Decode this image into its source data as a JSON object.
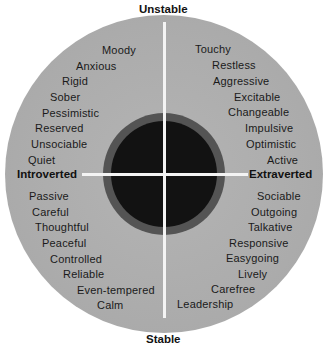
{
  "diagram": {
    "axes": {
      "top": "Unstable",
      "bottom": "Stable",
      "left": "Introverted",
      "right": "Extraverted"
    },
    "quadrants": {
      "unstable_introverted": [
        "Moody",
        "Anxious",
        "Rigid",
        "Sober",
        "Pessimistic",
        "Reserved",
        "Unsociable",
        "Quiet"
      ],
      "unstable_extraverted": [
        "Touchy",
        "Restless",
        "Aggressive",
        "Excitable",
        "Changeable",
        "Impulsive",
        "Optimistic",
        "Active"
      ],
      "stable_introverted": [
        "Passive",
        "Careful",
        "Thoughtful",
        "Peaceful",
        "Controlled",
        "Reliable",
        "Even-tempered",
        "Calm"
      ],
      "stable_extraverted": [
        "Sociable",
        "Outgoing",
        "Talkative",
        "Responsive",
        "Easygoing",
        "Lively",
        "Carefree",
        "Leadership"
      ]
    },
    "colors": {
      "outer_circle": "#acacac",
      "ring": "#545454",
      "core": "#121212",
      "axis_lines": "#f4f4f4",
      "text": "#1a1a1a"
    }
  }
}
